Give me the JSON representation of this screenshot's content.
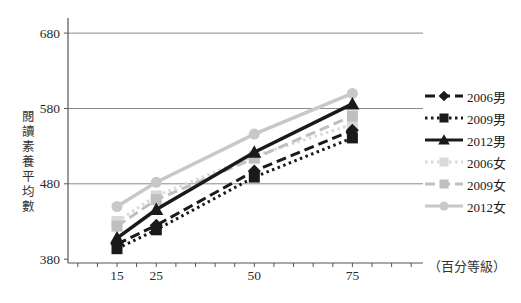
{
  "figure": {
    "background": "#ffffff",
    "title": ""
  },
  "chart_data": {
    "type": "line",
    "title": "",
    "xlabel": "（百分等級）",
    "ylabel": "閱讀素養平均數",
    "x": [
      15,
      25,
      50,
      75
    ],
    "x_ticks": [
      15,
      25,
      50,
      75
    ],
    "y_ticks": [
      380,
      480,
      580,
      680
    ],
    "xlim": [
      2.5,
      93
    ],
    "ylim": [
      375,
      700
    ],
    "x_minor_tick_step": 5,
    "grid": "horizontal",
    "legend_position": "right",
    "axis_color": "#555555",
    "gridline_color": "#8a8a8a",
    "series": [
      {
        "id": "male-2006",
        "name": "2006男",
        "color": "#1a1a1a",
        "line_style": "dashed",
        "marker": "diamond",
        "values": [
          400,
          425,
          497,
          551
        ]
      },
      {
        "id": "male-2009",
        "name": "2009男",
        "color": "#1a1a1a",
        "line_style": "dotted",
        "marker": "square",
        "values": [
          394,
          419,
          489,
          541
        ]
      },
      {
        "id": "male-2012",
        "name": "2012男",
        "color": "#1a1a1a",
        "line_style": "solid",
        "marker": "triangle",
        "values": [
          408,
          446,
          522,
          586
        ]
      },
      {
        "id": "female-2006",
        "name": "2006女",
        "color": "#d9d9d9",
        "line_style": "dotted",
        "marker": "square",
        "values": [
          430,
          464,
          517,
          559
        ]
      },
      {
        "id": "female-2009",
        "name": "2009女",
        "color": "#bfbfbf",
        "line_style": "dashed",
        "marker": "square",
        "values": [
          424,
          459,
          514,
          570
        ]
      },
      {
        "id": "female-2012",
        "name": "2012女",
        "color": "#c8c8c8",
        "line_style": "solid",
        "marker": "circle",
        "values": [
          450,
          482,
          546,
          600
        ]
      }
    ],
    "draw_order": [
      "female-2006",
      "female-2009",
      "female-2012",
      "male-2006",
      "male-2009",
      "male-2012"
    ]
  }
}
